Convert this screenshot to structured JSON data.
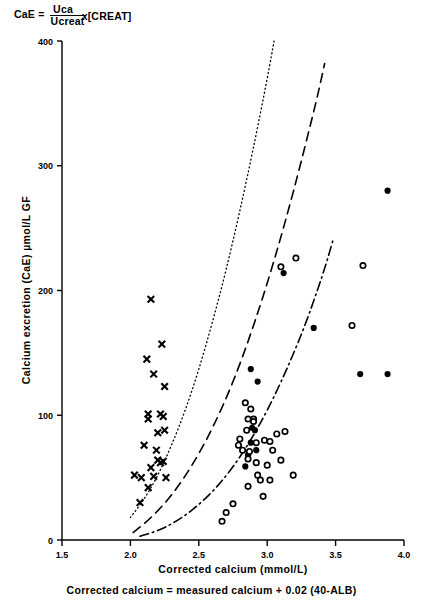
{
  "formula": {
    "lhs": "CaE  =",
    "numerator": "Uca",
    "denominator": "Ucreat",
    "tail": "x[CREAT]"
  },
  "axes": {
    "ylabel": "Calcium  excretion  (CaE)  µmol/L   GF",
    "xlabel": "Corrected   calcium   (mmol/L)",
    "caption": "Corrected  calcium  =  measured  calcium  +  0.02  (40-ALB)",
    "yticks": [
      "0",
      "100",
      "200",
      "300",
      "400"
    ],
    "xticks": [
      "1.5",
      "2.0",
      "2.5",
      "3.0",
      "3.5",
      "4.0"
    ]
  },
  "colors": {
    "ink": "#000000",
    "background": "#ffffff"
  },
  "chart_data": {
    "type": "scatter",
    "title": "",
    "xlabel": "Corrected calcium (mmol/L)",
    "ylabel": "Calcium excretion (CaE) µmol/L GF",
    "xlim": [
      1.5,
      4.0
    ],
    "ylim": [
      0,
      400
    ],
    "xticks": [
      1.5,
      2.0,
      2.5,
      3.0,
      3.5,
      4.0
    ],
    "yticks": [
      0,
      100,
      200,
      300,
      400
    ],
    "grid": false,
    "legend": "none",
    "series": [
      {
        "name": "cross-markers",
        "marker": "x",
        "fill": "solid",
        "points": [
          [
            2.15,
            193
          ],
          [
            2.23,
            157
          ],
          [
            2.12,
            145
          ],
          [
            2.17,
            133
          ],
          [
            2.25,
            123
          ],
          [
            2.13,
            101
          ],
          [
            2.13,
            97
          ],
          [
            2.22,
            101
          ],
          [
            2.24,
            99
          ],
          [
            2.2,
            86
          ],
          [
            2.25,
            88
          ],
          [
            2.1,
            76
          ],
          [
            2.19,
            72
          ],
          [
            2.2,
            64
          ],
          [
            2.22,
            62
          ],
          [
            2.24,
            63
          ],
          [
            2.15,
            58
          ],
          [
            2.03,
            52
          ],
          [
            2.08,
            50
          ],
          [
            2.17,
            51
          ],
          [
            2.26,
            50
          ],
          [
            2.13,
            42
          ],
          [
            2.07,
            30
          ]
        ]
      },
      {
        "name": "filled-circles",
        "marker": "o",
        "fill": "solid",
        "points": [
          [
            3.88,
            280
          ],
          [
            3.12,
            214
          ],
          [
            3.34,
            170
          ],
          [
            3.68,
            133
          ],
          [
            3.88,
            133
          ],
          [
            2.88,
            137
          ],
          [
            2.93,
            127
          ],
          [
            2.89,
            90
          ],
          [
            2.91,
            88
          ],
          [
            2.88,
            78
          ],
          [
            2.92,
            72
          ],
          [
            2.86,
            68
          ],
          [
            2.84,
            59
          ]
        ]
      },
      {
        "name": "open-circles",
        "marker": "o",
        "fill": "open",
        "points": [
          [
            3.7,
            220
          ],
          [
            3.1,
            219
          ],
          [
            3.21,
            226
          ],
          [
            3.62,
            172
          ],
          [
            2.84,
            110
          ],
          [
            2.88,
            105
          ],
          [
            2.86,
            97
          ],
          [
            2.9,
            97
          ],
          [
            2.9,
            95
          ],
          [
            2.85,
            88
          ],
          [
            2.8,
            81
          ],
          [
            2.79,
            76
          ],
          [
            2.92,
            78
          ],
          [
            2.98,
            80
          ],
          [
            3.02,
            79
          ],
          [
            3.07,
            85
          ],
          [
            3.13,
            87
          ],
          [
            3.04,
            72
          ],
          [
            2.82,
            72
          ],
          [
            2.87,
            71
          ],
          [
            2.86,
            65
          ],
          [
            2.92,
            62
          ],
          [
            3.0,
            60
          ],
          [
            3.1,
            64
          ],
          [
            2.93,
            52
          ],
          [
            2.95,
            48
          ],
          [
            3.02,
            48
          ],
          [
            3.19,
            52
          ],
          [
            2.86,
            43
          ],
          [
            2.97,
            35
          ],
          [
            2.75,
            29
          ],
          [
            2.7,
            22
          ],
          [
            2.67,
            15
          ]
        ]
      }
    ],
    "curves": [
      {
        "name": "upper-reference-curve",
        "style": "dotted",
        "points": [
          [
            2.0,
            18
          ],
          [
            2.1,
            33
          ],
          [
            2.2,
            52
          ],
          [
            2.3,
            76
          ],
          [
            2.4,
            104
          ],
          [
            2.5,
            137
          ],
          [
            2.6,
            175
          ],
          [
            2.7,
            217
          ],
          [
            2.8,
            264
          ],
          [
            2.9,
            315
          ],
          [
            3.0,
            370
          ],
          [
            3.05,
            400
          ]
        ]
      },
      {
        "name": "middle-reference-curve",
        "style": "dashed",
        "points": [
          [
            2.02,
            6
          ],
          [
            2.15,
            18
          ],
          [
            2.3,
            36
          ],
          [
            2.45,
            60
          ],
          [
            2.6,
            90
          ],
          [
            2.75,
            127
          ],
          [
            2.9,
            172
          ],
          [
            3.05,
            224
          ],
          [
            3.2,
            283
          ],
          [
            3.35,
            348
          ],
          [
            3.42,
            382
          ]
        ]
      },
      {
        "name": "lower-reference-curve",
        "style": "dash-dot",
        "points": [
          [
            2.07,
            3
          ],
          [
            2.25,
            10
          ],
          [
            2.45,
            24
          ],
          [
            2.65,
            45
          ],
          [
            2.85,
            75
          ],
          [
            3.05,
            115
          ],
          [
            3.25,
            165
          ],
          [
            3.4,
            211
          ],
          [
            3.48,
            240
          ]
        ]
      }
    ]
  }
}
